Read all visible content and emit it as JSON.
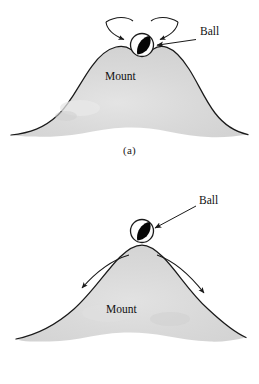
{
  "figure": {
    "type": "physics-stability-diagram",
    "background_color": "#ffffff",
    "line_color": "#1a1a1a",
    "mount_fill_color": "#d9d9d9",
    "ball_fill_color": "#ffffff",
    "ball_shadow_color": "#000000"
  },
  "panels": [
    {
      "id": "a",
      "caption": "(a)",
      "mount_label": "Mount",
      "ball_label": "Ball",
      "arrow_direction": "inward",
      "arrow_count": 2,
      "equilibrium": "stable"
    },
    {
      "id": "b",
      "caption": "(b)",
      "mount_label": "Mount",
      "ball_label": "Ball",
      "arrow_direction": "outward",
      "arrow_count": 2,
      "equilibrium": "unstable"
    }
  ],
  "labels": {
    "ball_a": "Ball",
    "ball_b": "Ball",
    "mount_a": "Mount",
    "mount_b": "Mount",
    "caption_a": "(a)",
    "caption_b": "(b)"
  }
}
